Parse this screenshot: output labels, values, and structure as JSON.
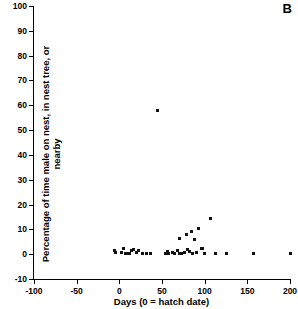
{
  "panel": {
    "label": "B"
  },
  "chart_data": {
    "type": "scatter",
    "title": "",
    "xlabel": "Days (0 = hatch date)",
    "ylabel": "Percentage of time male on nest, in nest tree, or nearby",
    "xlim": [
      -100,
      200
    ],
    "ylim": [
      -10,
      100
    ],
    "xticks": [
      -100,
      -50,
      0,
      50,
      100,
      150,
      200
    ],
    "xtick_labels": [
      "-100",
      "-50",
      "0",
      "50",
      "100",
      "150",
      "200"
    ],
    "yticks": [
      -10,
      0,
      10,
      20,
      30,
      40,
      50,
      60,
      70,
      80,
      90,
      100
    ],
    "ytick_labels": [
      "-10",
      "0",
      "10",
      "20",
      "30",
      "40",
      "50",
      "60",
      "70",
      "80",
      "90",
      "100"
    ],
    "grid": false,
    "legend": false,
    "marker": "square",
    "marker_color": "#111111",
    "points": [
      {
        "x": -6,
        "y": 1.5
      },
      {
        "x": -5,
        "y": 0.5
      },
      {
        "x": 2,
        "y": 0.8
      },
      {
        "x": 5,
        "y": 2.2
      },
      {
        "x": 7,
        "y": 0.3
      },
      {
        "x": 9,
        "y": 0.2
      },
      {
        "x": 12,
        "y": 0.4
      },
      {
        "x": 14,
        "y": 1.6
      },
      {
        "x": 17,
        "y": 1.8
      },
      {
        "x": 20,
        "y": 0.6
      },
      {
        "x": 22,
        "y": 1.4
      },
      {
        "x": 27,
        "y": 0.2
      },
      {
        "x": 32,
        "y": 0.3
      },
      {
        "x": 37,
        "y": 0.2
      },
      {
        "x": 45,
        "y": 58.0
      },
      {
        "x": 54,
        "y": 0.4
      },
      {
        "x": 56,
        "y": 1.2
      },
      {
        "x": 58,
        "y": 0.3
      },
      {
        "x": 62,
        "y": 0.8
      },
      {
        "x": 65,
        "y": 0.2
      },
      {
        "x": 68,
        "y": 1.5
      },
      {
        "x": 70,
        "y": 0.3
      },
      {
        "x": 71,
        "y": 6.5
      },
      {
        "x": 73,
        "y": 0.4
      },
      {
        "x": 76,
        "y": 0.6
      },
      {
        "x": 79,
        "y": 8.0
      },
      {
        "x": 80,
        "y": 2.0
      },
      {
        "x": 82,
        "y": 1.0
      },
      {
        "x": 84,
        "y": 9.2
      },
      {
        "x": 86,
        "y": 0.4
      },
      {
        "x": 88,
        "y": 6.0
      },
      {
        "x": 90,
        "y": 0.5
      },
      {
        "x": 93,
        "y": 10.5
      },
      {
        "x": 96,
        "y": 2.2
      },
      {
        "x": 98,
        "y": 2.4
      },
      {
        "x": 100,
        "y": 0.3
      },
      {
        "x": 107,
        "y": 14.5
      },
      {
        "x": 113,
        "y": 0.2
      },
      {
        "x": 126,
        "y": 0.2
      },
      {
        "x": 157,
        "y": 0.2
      },
      {
        "x": 200,
        "y": 0.2
      }
    ]
  }
}
